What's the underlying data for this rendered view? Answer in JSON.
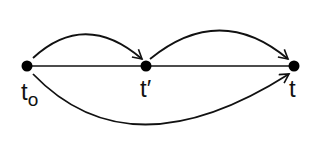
{
  "diagram": {
    "type": "directed-graph",
    "nodes": [
      {
        "id": "t0",
        "label": "t",
        "subscript": "o",
        "x": 27,
        "y": 66
      },
      {
        "id": "tprime",
        "label": "t′",
        "x": 146,
        "y": 66
      },
      {
        "id": "t",
        "label": "t",
        "x": 294,
        "y": 66
      }
    ],
    "edges": [
      {
        "from": "t0",
        "to": "tprime",
        "style": "line",
        "directed": false
      },
      {
        "from": "tprime",
        "to": "t",
        "style": "line",
        "directed": false
      },
      {
        "from": "t0",
        "to": "tprime",
        "style": "arc-above",
        "directed": true
      },
      {
        "from": "tprime",
        "to": "t",
        "style": "arc-above",
        "directed": true
      },
      {
        "from": "t0",
        "to": "t",
        "style": "arc-below",
        "directed": true
      }
    ],
    "colors": {
      "stroke": "#111111",
      "node": "#000000",
      "background": "#ffffff"
    }
  }
}
